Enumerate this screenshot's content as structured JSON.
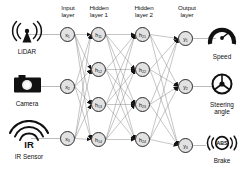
{
  "diagram": {
    "background": "#ffffff",
    "node_fill": "#e2e2e2",
    "node_stroke": "#2a2a2a",
    "edge_color": "#8d8d8d",
    "arrow_color": "#111111"
  },
  "column_headers": [
    {
      "label": "Input\nlayer",
      "line1": "Input",
      "line2": "layer"
    },
    {
      "label": "Hidden\nlayer 1",
      "line1": "Hidden",
      "line2": "layer 1"
    },
    {
      "label": "Hidden\nlayer 2",
      "line1": "Hidden",
      "line2": "layer 2"
    },
    {
      "label": "Output\nlayer",
      "line1": "Output",
      "line2": "layer"
    }
  ],
  "sensors": [
    {
      "label": "LiDAR",
      "icon": "lidar-antenna-icon"
    },
    {
      "label": "Camera",
      "icon": "camera-icon"
    },
    {
      "label": "IR Sensor",
      "icon": "ir-wave-icon",
      "icon_text": "IR"
    }
  ],
  "actuators": [
    {
      "label": "Speed",
      "icon": "speedometer-icon"
    },
    {
      "label": "Steering angle",
      "line1": "Steering",
      "line2": "angle",
      "icon": "steering-wheel-icon"
    },
    {
      "label": "Brake",
      "icon": "abs-brake-icon",
      "icon_text": "ABS"
    }
  ],
  "layers": {
    "input": {
      "name": "Input layer",
      "nodes": [
        {
          "base": "x",
          "sub": "1"
        },
        {
          "base": "x",
          "sub": "2"
        },
        {
          "base": "x",
          "sub": "3"
        }
      ]
    },
    "hidden1": {
      "name": "Hidden layer 1",
      "nodes": [
        {
          "base": "h",
          "sub": "11"
        },
        {
          "base": "h",
          "sub": "12"
        },
        {
          "base": "h",
          "sub": "13"
        },
        {
          "base": "h",
          "sub": "14"
        }
      ]
    },
    "hidden2": {
      "name": "Hidden layer 2",
      "nodes": [
        {
          "base": "h",
          "sub": "21"
        },
        {
          "base": "h",
          "sub": "22"
        },
        {
          "base": "h",
          "sub": "23"
        },
        {
          "base": "h",
          "sub": "24"
        }
      ]
    },
    "output": {
      "name": "Output layer",
      "nodes": [
        {
          "base": "y",
          "sub": "1"
        },
        {
          "base": "y",
          "sub": "2"
        },
        {
          "base": "y",
          "sub": "3"
        }
      ]
    }
  }
}
